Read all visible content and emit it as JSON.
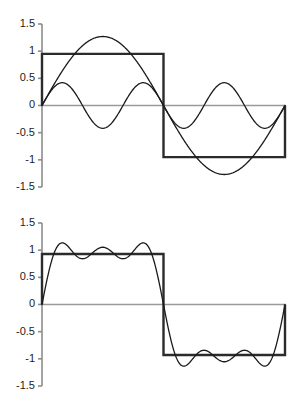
{
  "figure": {
    "panel_count": 2,
    "background_color": "#ffffff"
  },
  "style": {
    "square_wave_color": "#2b2b2b",
    "harmonic_color": "#1a1a1a",
    "partial_sum_color": "#1a1a1a",
    "axis_color": "#8c8c8c",
    "zero_line_color": "#9a9a9a",
    "square_wave_width": 2.4,
    "curve_width": 1.3,
    "axis_width": 1.6,
    "tick_length": 4
  },
  "chart_data": [
    {
      "type": "line",
      "panel": "top",
      "title": "",
      "xlabel": "",
      "ylabel": "",
      "xlim": [
        0,
        1
      ],
      "ylim": [
        -1.5,
        1.5
      ],
      "grid": false,
      "legend": "none",
      "yticks": [
        1.5,
        1,
        0.5,
        0,
        -0.5,
        -1,
        -1.5
      ],
      "ytick_labels": [
        "1.5",
        "1",
        "0.5",
        "0",
        "-0.5",
        "-1",
        "-1.5"
      ],
      "xticks": [],
      "xtick_labels": [],
      "annotations": [],
      "series": [
        {
          "name": "square wave",
          "kind": "square",
          "amplitude": 0.95,
          "color": "#2b2b2b",
          "points": [
            [
              0.0,
              0.0
            ],
            [
              0.0,
              0.95
            ],
            [
              0.5,
              0.95
            ],
            [
              0.5,
              -0.95
            ],
            [
              1.0,
              -0.95
            ],
            [
              1.0,
              0.0
            ]
          ]
        },
        {
          "name": "first harmonic (n=1)",
          "kind": "sine",
          "harmonic": 1,
          "amplitude": 1.27,
          "cycles": 1,
          "color": "#1a1a1a"
        },
        {
          "name": "third harmonic (n=3)",
          "kind": "sine",
          "harmonic": 3,
          "amplitude": 0.42,
          "cycles": 3,
          "color": "#1a1a1a"
        }
      ]
    },
    {
      "type": "line",
      "panel": "bottom",
      "title": "",
      "xlabel": "",
      "ylabel": "",
      "xlim": [
        0,
        1
      ],
      "ylim": [
        -1.5,
        1.5
      ],
      "grid": false,
      "legend": "none",
      "yticks": [
        1.5,
        1,
        0.5,
        0,
        -0.5,
        -1,
        -1.5
      ],
      "ytick_labels": [
        "1.5",
        "1",
        "0.5",
        "0",
        "-0.5",
        "-1",
        "-1.5"
      ],
      "xticks": [],
      "xtick_labels": [],
      "annotations": [],
      "series": [
        {
          "name": "square wave",
          "kind": "square",
          "amplitude": 0.93,
          "color": "#2b2b2b",
          "points": [
            [
              0.0,
              0.0
            ],
            [
              0.0,
              0.93
            ],
            [
              0.5,
              0.93
            ],
            [
              0.5,
              -0.93
            ],
            [
              1.0,
              -0.93
            ],
            [
              1.0,
              0.0
            ]
          ]
        },
        {
          "name": "partial sum (harmonics 1,3,5)",
          "kind": "partial_sum",
          "harmonics": [
            1,
            3,
            5
          ],
          "scale": 1.18,
          "peak_overshoot": 1.22,
          "color": "#1a1a1a"
        }
      ]
    }
  ]
}
